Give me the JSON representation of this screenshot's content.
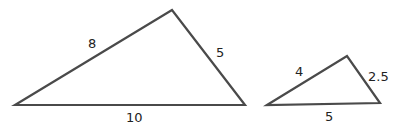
{
  "diagram": {
    "type": "similar-triangles",
    "stroke_color": "#4a4a4a",
    "triangles": [
      {
        "name": "large-triangle",
        "vertices": [
          [
            15,
            105
          ],
          [
            172,
            10
          ],
          [
            245,
            105
          ]
        ],
        "sides": {
          "left": "8",
          "right": "5",
          "base": "10"
        },
        "label_positions": {
          "left": [
            88,
            48
          ],
          "right": [
            216,
            57
          ],
          "base": [
            126,
            122
          ]
        }
      },
      {
        "name": "small-triangle",
        "vertices": [
          [
            267,
            105
          ],
          [
            347,
            56
          ],
          [
            380,
            103
          ]
        ],
        "sides": {
          "left": "4",
          "right": "2.5",
          "base": "5"
        },
        "label_positions": {
          "left": [
            295,
            76
          ],
          "right": [
            368,
            81
          ],
          "base": [
            325,
            121
          ]
        }
      }
    ]
  }
}
